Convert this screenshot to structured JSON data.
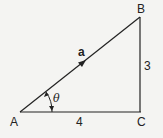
{
  "diagram": {
    "type": "right-triangle-vector",
    "vertices": {
      "A": {
        "label": "A"
      },
      "B": {
        "label": "B"
      },
      "C": {
        "label": "C"
      }
    },
    "sides": {
      "AC": {
        "label": "4"
      },
      "BC": {
        "label": "3"
      },
      "AB": {
        "label": "a",
        "vector": true
      }
    },
    "angle": {
      "label": "θ",
      "at": "A"
    },
    "colors": {
      "line": "#222222",
      "background": "#f4f4f2"
    }
  }
}
